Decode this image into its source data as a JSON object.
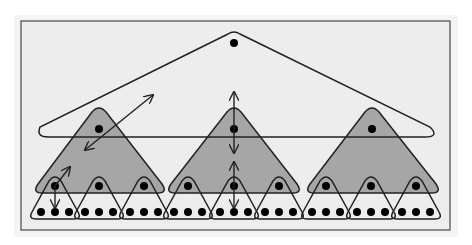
{
  "diagram": {
    "title": "",
    "colors": {
      "background": "#ededed",
      "frame": "#555555",
      "stroke": "#222222",
      "shaded": "#a6a6a6",
      "node": "#000000",
      "outer_white": "#ffffff"
    },
    "levels": [
      {
        "name": "root",
        "count": 1
      },
      {
        "name": "subtree",
        "count": 3
      },
      {
        "name": "leaf-group",
        "count": 9
      },
      {
        "name": "leaf",
        "count": 27
      }
    ],
    "arrows": [
      {
        "name": "diagonal-double-arrow-left",
        "from": [
          86,
          150
        ],
        "to": [
          153,
          95
        ]
      },
      {
        "name": "small-diagonal-arrow",
        "from": [
          55,
          185
        ],
        "to": [
          70,
          167
        ]
      },
      {
        "name": "small-down-arrow-left",
        "from": [
          55,
          185
        ],
        "to": [
          55,
          210
        ]
      },
      {
        "name": "vertical-double-arrow-center-top",
        "from": [
          234,
          150
        ],
        "to": [
          234,
          92
        ]
      },
      {
        "name": "vertical-double-arrow-center-bottom",
        "from": [
          234,
          161
        ],
        "to": [
          234,
          212
        ]
      }
    ]
  }
}
